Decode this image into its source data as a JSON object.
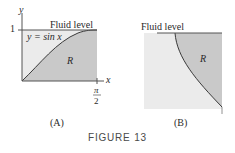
{
  "figure": {
    "caption": "FIGURE 13",
    "colors": {
      "light_fill": "#ebebeb",
      "dark_fill": "#c9c9c9",
      "line": "#3a3a3a",
      "caption": "#4a4a4a"
    },
    "panels": [
      {
        "id": "A",
        "label": "(A)",
        "top_label": "Fluid level",
        "curve_label": "y = sin x",
        "region_label": "R",
        "y_axis_label": "y",
        "x_axis_label": "x",
        "y_tick": "1",
        "x_tick_num": "π",
        "x_tick_den": "2"
      },
      {
        "id": "B",
        "label": "(B)",
        "top_label": "Fluid level",
        "region_label": "R"
      }
    ]
  }
}
